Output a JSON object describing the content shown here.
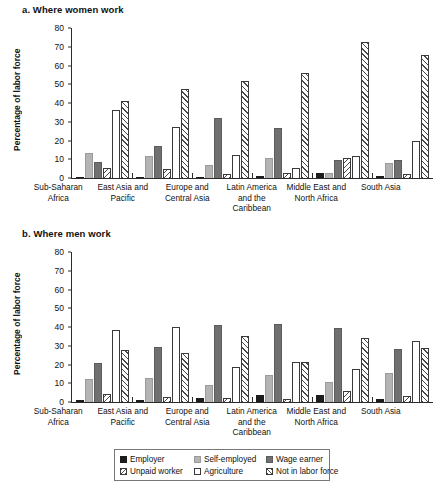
{
  "panels": [
    {
      "key": "a",
      "title": "a. Where women work"
    },
    {
      "key": "b",
      "title": "b. Where men work"
    }
  ],
  "axis": {
    "ylabel": "Percentage of labor force",
    "yticks": [
      "0",
      "10",
      "20",
      "30",
      "40",
      "50",
      "60",
      "70",
      "80"
    ]
  },
  "legend": {
    "items": [
      {
        "label": "Employer",
        "key": "employer"
      },
      {
        "label": "Self-employed",
        "key": "selfemployed"
      },
      {
        "label": "Wage earner",
        "key": "wageearner"
      },
      {
        "label": "Unpaid worker",
        "key": "unpaid"
      },
      {
        "label": "Agriculture",
        "key": "agriculture"
      },
      {
        "label": "Not in labor force",
        "key": "notinlabor"
      }
    ]
  },
  "chart_data": [
    {
      "type": "bar",
      "title": "a. Where women work",
      "xlabel": "",
      "ylabel": "Percentage of labor force",
      "ylim": [
        0,
        80
      ],
      "yticks": [
        0,
        10,
        20,
        30,
        40,
        50,
        60,
        70,
        80
      ],
      "grid": false,
      "legend_position": "bottom",
      "categories": [
        "Sub-Saharan Africa",
        "East Asia and Pacific",
        "Europe and Central Asia",
        "Latin America and the Caribbean",
        "Middle East and North Africa",
        "South Asia"
      ],
      "series": [
        {
          "name": "Employer",
          "values": [
            0.4,
            0.5,
            0.8,
            1.0,
            2.5,
            1.0
          ]
        },
        {
          "name": "Self-employed",
          "values": [
            13.2,
            11.6,
            7.0,
            10.8,
            2.5,
            8.2
          ]
        },
        {
          "name": "Wage earner",
          "values": [
            8.6,
            17.2,
            32.2,
            26.7,
            9.5,
            9.8
          ]
        },
        {
          "name": "Unpaid worker",
          "values": [
            5.3,
            4.7,
            1.9,
            2.6,
            10.5,
            2.3
          ]
        },
        {
          "name": "Agriculture",
          "values": [
            36.1,
            27.4,
            12.4,
            5.5,
            11.5,
            19.5
          ]
        },
        {
          "name": "Not in labor force",
          "values": [
            41.3,
            47.3,
            52.0,
            56.0,
            72.5,
            65.7
          ]
        }
      ]
    },
    {
      "type": "bar",
      "title": "b. Where men work",
      "xlabel": "",
      "ylabel": "Percentage of labor force",
      "ylim": [
        0,
        80
      ],
      "yticks": [
        0,
        10,
        20,
        30,
        40,
        50,
        60,
        70,
        80
      ],
      "grid": false,
      "legend_position": "bottom",
      "categories": [
        "Sub-Saharan Africa",
        "East Asia and Pacific",
        "Europe and Central Asia",
        "Latin America and the Caribbean",
        "Middle East and North Africa",
        "South Asia"
      ],
      "series": [
        {
          "name": "Employer",
          "values": [
            1.2,
            1.0,
            2.2,
            3.7,
            3.5,
            1.4
          ]
        },
        {
          "name": "Self-employed",
          "values": [
            12.4,
            12.9,
            9.0,
            14.2,
            10.8,
            15.3
          ]
        },
        {
          "name": "Wage earner",
          "values": [
            21.0,
            29.5,
            41.2,
            41.8,
            39.5,
            28.3
          ]
        },
        {
          "name": "Unpaid worker",
          "values": [
            4.4,
            2.6,
            2.4,
            1.5,
            5.9,
            3.2
          ]
        },
        {
          "name": "Agriculture",
          "values": [
            38.3,
            40.1,
            18.8,
            21.3,
            17.7,
            32.5
          ]
        },
        {
          "name": "Not in labor force",
          "values": [
            27.9,
            26.0,
            35.3,
            21.6,
            34.0,
            28.6
          ]
        }
      ]
    }
  ],
  "layout": {
    "panel_a": {
      "title_top": 4,
      "plot_top": 28,
      "plot_height": 150,
      "xlabels_top": 182
    },
    "panel_b": {
      "title_top": 228,
      "plot_top": 252,
      "plot_height": 150,
      "xlabels_top": 406
    }
  }
}
